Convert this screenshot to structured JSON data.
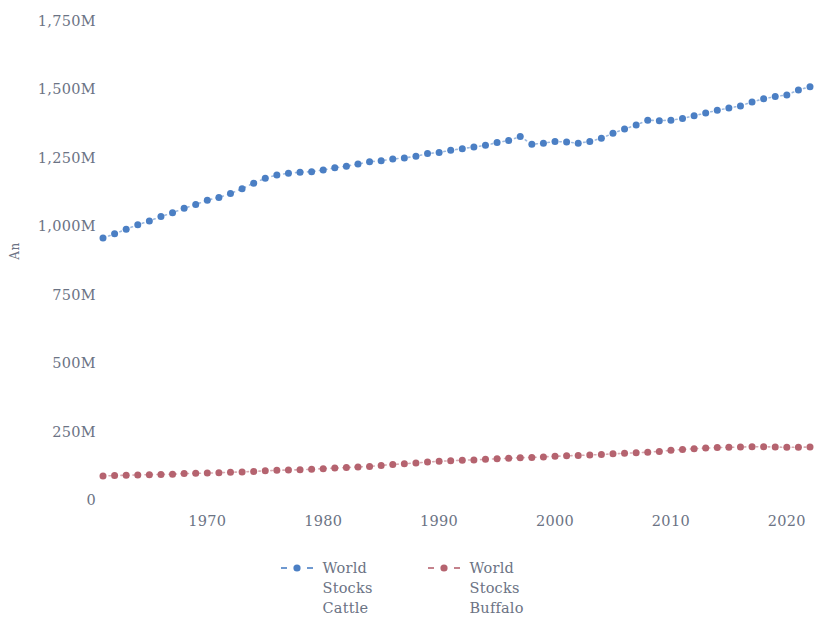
{
  "chart_data": {
    "type": "line",
    "title": "",
    "subtitle": "",
    "xlabel": "",
    "ylabel": "An",
    "xlim": [
      1960,
      2022
    ],
    "ylim": [
      0,
      1750
    ],
    "grid": false,
    "legend_position": "bottom",
    "y_unit": "M",
    "y_ticks": [
      0,
      250,
      500,
      750,
      1000,
      1250,
      1500,
      1750
    ],
    "y_tick_labels": [
      "0",
      "250M",
      "500M",
      "750M",
      "1,000M",
      "1,250M",
      "1,500M",
      "1,750M"
    ],
    "x_ticks": [
      1970,
      1980,
      1990,
      2000,
      2010,
      2020
    ],
    "x_tick_labels": [
      "1970",
      "1980",
      "1990",
      "2000",
      "2010",
      "2020"
    ],
    "marker": "circle",
    "linestyle": "dotted",
    "x": [
      1961,
      1962,
      1963,
      1964,
      1965,
      1966,
      1967,
      1968,
      1969,
      1970,
      1971,
      1972,
      1973,
      1974,
      1975,
      1976,
      1977,
      1978,
      1979,
      1980,
      1981,
      1982,
      1983,
      1984,
      1985,
      1986,
      1987,
      1988,
      1989,
      1990,
      1991,
      1992,
      1993,
      1994,
      1995,
      1996,
      1997,
      1998,
      1999,
      2000,
      2001,
      2002,
      2003,
      2004,
      2005,
      2006,
      2007,
      2008,
      2009,
      2010,
      2011,
      2012,
      2013,
      2014,
      2015,
      2016,
      2017,
      2018,
      2019,
      2020,
      2021,
      2022
    ],
    "series": [
      {
        "name": "World Stocks Cattle",
        "color": "#4b7fc4",
        "values": [
          960,
          975,
          992,
          1008,
          1022,
          1038,
          1052,
          1068,
          1082,
          1098,
          1108,
          1122,
          1140,
          1160,
          1178,
          1190,
          1196,
          1200,
          1202,
          1208,
          1216,
          1222,
          1230,
          1238,
          1242,
          1248,
          1252,
          1258,
          1268,
          1272,
          1280,
          1286,
          1292,
          1298,
          1308,
          1316,
          1330,
          1302,
          1306,
          1312,
          1310,
          1306,
          1312,
          1324,
          1342,
          1358,
          1372,
          1390,
          1388,
          1390,
          1396,
          1406,
          1416,
          1426,
          1434,
          1442,
          1456,
          1468,
          1476,
          1482,
          1500,
          1512
        ]
      },
      {
        "name": "World Stocks Buffalo",
        "color": "#b5636f",
        "values": [
          91,
          93,
          94,
          95,
          96,
          97,
          98,
          100,
          101,
          102,
          103,
          105,
          106,
          108,
          110,
          112,
          113,
          114,
          116,
          118,
          120,
          122,
          124,
          126,
          130,
          133,
          136,
          139,
          142,
          145,
          147,
          149,
          150,
          152,
          154,
          156,
          158,
          159,
          161,
          163,
          165,
          166,
          168,
          170,
          172,
          174,
          176,
          178,
          181,
          185,
          188,
          191,
          193,
          195,
          196,
          197,
          198,
          198,
          197,
          196,
          196,
          197
        ]
      }
    ]
  },
  "axes": {
    "y_title": "An"
  },
  "legend": {
    "items": [
      {
        "label": "World Stocks Cattle",
        "color": "#4b7fc4"
      },
      {
        "label": "World Stocks Buffalo",
        "color": "#b5636f"
      }
    ]
  }
}
